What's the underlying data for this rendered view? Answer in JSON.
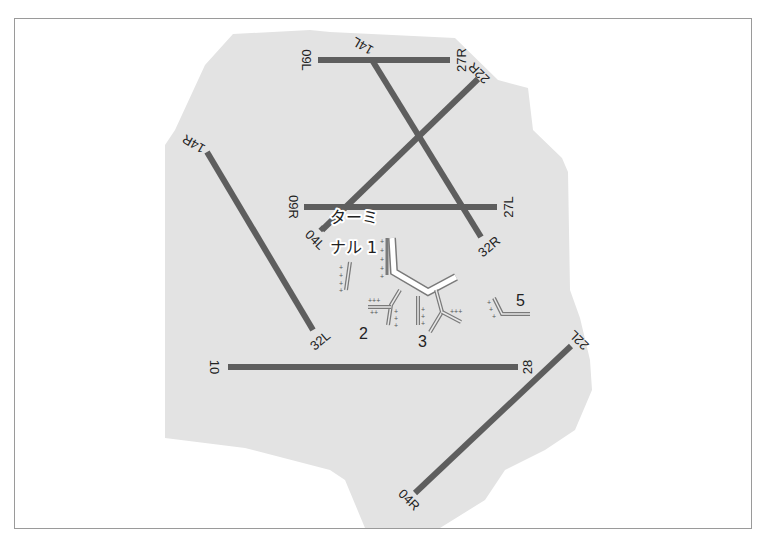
{
  "map": {
    "colors": {
      "background": "#ffffff",
      "airport_area": "#e3e3e3",
      "runway": "#5e5e5e",
      "terminal_outline": "#7a7a7a",
      "main_terminal_fill": "#ffffff",
      "frame_border": "#9a9a9a"
    },
    "runways": [
      {
        "id": "09L-27R",
        "ends": [
          "09L",
          "27R"
        ]
      },
      {
        "id": "09R-27L",
        "ends": [
          "09R",
          "27L"
        ]
      },
      {
        "id": "10-28",
        "ends": [
          "10",
          "28"
        ]
      },
      {
        "id": "14L-32R",
        "ends": [
          "14L",
          "32R"
        ]
      },
      {
        "id": "14R-32L",
        "ends": [
          "14R",
          "32L"
        ]
      },
      {
        "id": "04L-22R",
        "ends": [
          "04L",
          "22R"
        ]
      },
      {
        "id": "04R-22L",
        "ends": [
          "04R",
          "22L"
        ]
      }
    ],
    "labels": {
      "r09L": "09L",
      "r27R": "27R",
      "r14L": "14L",
      "r22R": "22R",
      "r14R": "14R",
      "r09R": "09R",
      "r04L": "04L",
      "r27L": "27L",
      "r32R": "32R",
      "r32L": "32L",
      "r10": "10",
      "r28": "28",
      "r22L": "22L",
      "r04R": "04R"
    },
    "terminals": {
      "t1_line1": "ターミ",
      "t1_line2": "ナル 1",
      "t2": "2",
      "t3": "3",
      "t5": "5"
    }
  }
}
